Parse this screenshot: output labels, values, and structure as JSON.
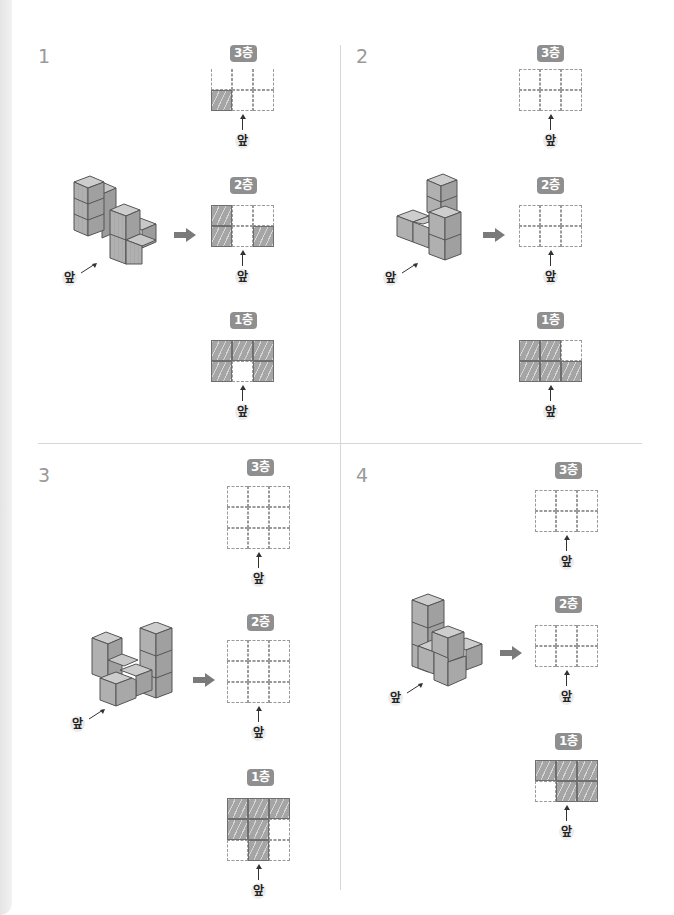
{
  "front_label": "앞",
  "problems": [
    {
      "number": "1",
      "layers": [
        {
          "label": "3층",
          "rows": 2,
          "cols": 3,
          "cells": [
            [
              0,
              0,
              0
            ],
            [
              1,
              0,
              0
            ]
          ],
          "partial": true
        },
        {
          "label": "2층",
          "rows": 2,
          "cols": 3,
          "cells": [
            [
              1,
              0,
              0
            ],
            [
              1,
              0,
              1
            ]
          ]
        },
        {
          "label": "1층",
          "rows": 2,
          "cols": 3,
          "cells": [
            [
              1,
              1,
              1
            ],
            [
              1,
              0,
              1
            ]
          ]
        }
      ]
    },
    {
      "number": "2",
      "layers": [
        {
          "label": "3층",
          "rows": 2,
          "cols": 3,
          "cells": [
            [
              0,
              0,
              0
            ],
            [
              0,
              0,
              0
            ]
          ]
        },
        {
          "label": "2층",
          "rows": 2,
          "cols": 3,
          "cells": [
            [
              0,
              0,
              0
            ],
            [
              0,
              0,
              0
            ]
          ]
        },
        {
          "label": "1층",
          "rows": 2,
          "cols": 3,
          "cells": [
            [
              1,
              1,
              0
            ],
            [
              1,
              1,
              1
            ]
          ]
        }
      ]
    },
    {
      "number": "3",
      "layers": [
        {
          "label": "3층",
          "rows": 3,
          "cols": 3,
          "cells": [
            [
              0,
              0,
              0
            ],
            [
              0,
              0,
              0
            ],
            [
              0,
              0,
              0
            ]
          ]
        },
        {
          "label": "2층",
          "rows": 3,
          "cols": 3,
          "cells": [
            [
              0,
              0,
              0
            ],
            [
              0,
              0,
              0
            ],
            [
              0,
              0,
              0
            ]
          ]
        },
        {
          "label": "1층",
          "rows": 3,
          "cols": 3,
          "cells": [
            [
              1,
              1,
              1
            ],
            [
              1,
              1,
              0
            ],
            [
              0,
              1,
              0
            ]
          ]
        }
      ]
    },
    {
      "number": "4",
      "layers": [
        {
          "label": "3층",
          "rows": 2,
          "cols": 3,
          "cells": [
            [
              0,
              0,
              0
            ],
            [
              0,
              0,
              0
            ]
          ]
        },
        {
          "label": "2층",
          "rows": 2,
          "cols": 3,
          "cells": [
            [
              0,
              0,
              0
            ],
            [
              0,
              0,
              0
            ]
          ]
        },
        {
          "label": "1층",
          "rows": 2,
          "cols": 3,
          "cells": [
            [
              1,
              1,
              1
            ],
            [
              0,
              1,
              1
            ]
          ]
        }
      ]
    }
  ],
  "colors": {
    "filled": "#a5a5a5",
    "badge": "#8f8f8f",
    "number": "#9a9a9a",
    "arrow": "#7a7a7a"
  }
}
